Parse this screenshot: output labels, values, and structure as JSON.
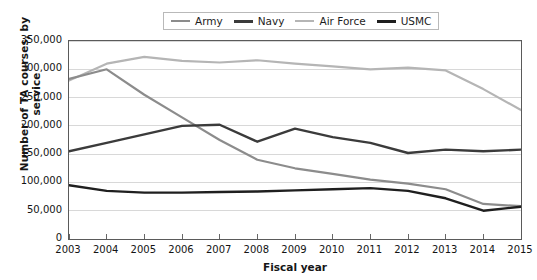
{
  "chart_data": {
    "type": "line",
    "title": "",
    "xlabel": "Fiscal year",
    "ylabel": "Number of TA courses, by service",
    "categories": [
      "2003",
      "2004",
      "2005",
      "2006",
      "2007",
      "2008",
      "2009",
      "2010",
      "2011",
      "2012",
      "2013",
      "2014",
      "2015"
    ],
    "x": [
      2003,
      2004,
      2005,
      2006,
      2007,
      2008,
      2009,
      2010,
      2011,
      2012,
      2013,
      2014,
      2015
    ],
    "ylim": [
      0,
      350000
    ],
    "xlim": [
      2003,
      2015
    ],
    "y_ticks": [
      0,
      50000,
      100000,
      150000,
      200000,
      250000,
      300000,
      350000
    ],
    "y_tick_labels": [
      "0",
      "50,000",
      "100,000",
      "150,000",
      "200,000",
      "250,000",
      "300,000",
      "350,000"
    ],
    "grid": "horizontal",
    "legend_position": "top-center",
    "series": [
      {
        "name": "Army",
        "color": "#8c8c8c",
        "width": 2.2,
        "values": [
          283000,
          300000,
          255000,
          215000,
          175000,
          140000,
          125000,
          115000,
          105000,
          98000,
          88000,
          62000,
          58000
        ]
      },
      {
        "name": "Navy",
        "color": "#3b3b3b",
        "width": 2.4,
        "values": [
          155000,
          170000,
          185000,
          200000,
          202000,
          172000,
          195000,
          180000,
          170000,
          152000,
          158000,
          155000,
          158000
        ]
      },
      {
        "name": "Air Force",
        "color": "#b5b5b5",
        "width": 2.2,
        "values": [
          280000,
          310000,
          322000,
          315000,
          312000,
          316000,
          310000,
          305000,
          300000,
          303000,
          298000,
          265000,
          228000
        ]
      },
      {
        "name": "USMC",
        "color": "#1f1f1f",
        "width": 2.4,
        "values": [
          95000,
          85000,
          82000,
          82000,
          83000,
          84000,
          86000,
          88000,
          90000,
          85000,
          72000,
          50000,
          57000
        ]
      }
    ]
  },
  "legend": {
    "items": [
      {
        "label": "Army",
        "color": "#8c8c8c",
        "thickness": "2px"
      },
      {
        "label": "Navy",
        "color": "#3b3b3b",
        "thickness": "3px"
      },
      {
        "label": "Air Force",
        "color": "#b5b5b5",
        "thickness": "2px"
      },
      {
        "label": "USMC",
        "color": "#1f1f1f",
        "thickness": "3px"
      }
    ]
  },
  "axes": {
    "y_title": "Number of TA courses, by service",
    "x_title": "Fiscal year"
  },
  "style": {
    "grid_color": "#d8d8d8",
    "frame_color": "#5a5a5a",
    "axis_color": "#1a1a1a",
    "background": "#ffffff"
  }
}
